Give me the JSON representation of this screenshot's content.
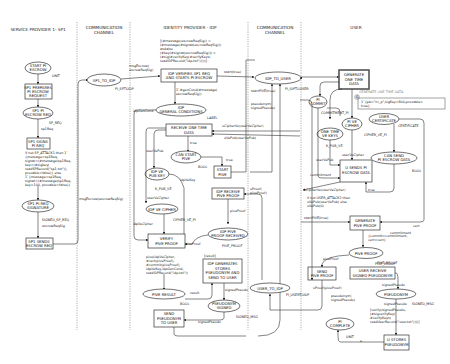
{
  "lanes": [
    {
      "title_1": "SERVICE PROVIDER 1- SP1",
      "title_2": ""
    },
    {
      "title_1": "COMMUNICATION",
      "title_2": "CHANNEL"
    },
    {
      "title_1": "IDENTITY PROVIDER - IDP",
      "title_2": ""
    },
    {
      "title_1": "COMMUNICATION",
      "title_2": "CHANNEL"
    },
    {
      "title_1": "USER",
      "title_2": ""
    }
  ],
  "sp1": {
    "start": {
      "l1": "START PI",
      "l2": "ESCROW",
      "type": "UNIT"
    },
    "prepares": {
      "l1": "SP1 PREPARES",
      "l2": "PI ESCROW",
      "l3": "REQUEST"
    },
    "req": {
      "l1": "SP1 PI",
      "l2": "ESCROW REQ",
      "type": "SP_REQ",
      "arc": "sp1Req"
    },
    "signs": {
      "l1": "SP1 SIGNS",
      "l2": "PI REQ"
    },
    "guard": [
      "if not SP_ATTACK1 then 1`",
      "{message=sp1Req,",
      "signat=(#message(sp1Req,",
      "key=(#sigkey(",
      "readSPRecord(\"sp1.txt\")),",
      "provable=false)} else",
      "1`{message=sp1Req,",
      "signat=(#message(sp1Req,",
      "key=100, provable=false)}"
    ],
    "signature": {
      "l1": "SP1 PI REQ",
      "l2": "SIGNATURE",
      "type": "SIGNED_SP_REQ",
      "arc": "escrowReqSig"
    },
    "sends": {
      "l1": "SP1 SENDS",
      "l2": "ESCROW REQ"
    }
  },
  "channel1": {
    "place": "SP1_TO_IDP",
    "type": "PI_SPTOIDP",
    "arc_in": "msgEscrow(escrowReqSig)",
    "arc_out_1": "msgEscrow(",
    "arc_out_2": "escrowReqSig)"
  },
  "idp": {
    "guard_top": [
      "[(#message(escrowReqSig)) =",
      "(#message(#signat(escrowReqSig)))",
      "andalso",
      "(#key(#signat(escrowReqSig))) =",
      "(#sig(#verifyKey(#verifyKeys(",
      "readIDPRecord(\"idp.txt\")))))]"
    ],
    "verifies": {
      "l1": "IDP VERIFIES SP1 REQ",
      "l2": "AND STARTS PI ESCROW"
    },
    "gen_arc_1": "1`#genCond(#message(",
    "gen_arc_2": "escrowReqSig))",
    "idpGenCond": "idpGenCond",
    "gen_cond": {
      "l1": "IDP",
      "l2": "GENERAL CONDITIONS",
      "type": "LABEL"
    },
    "receive": {
      "l1": "RECEIVE ONE TIME",
      "l2": "DATA"
    },
    "arc_ucipher": "uCipherVe(userVeCipher)",
    "arc_uvepub": "uVePub(userVePub)",
    "true1": "true",
    "can_start": {
      "l1": "CAN START",
      "l2": "PIVE",
      "type": "BOOL"
    },
    "true2": "true",
    "start_pive": {
      "l1": "START",
      "l2": "PIVE"
    },
    "userVePub": "userVePub",
    "ve_pub": {
      "l1": "IDP VE",
      "l2": "PUB KEY",
      "type": "K_PUB_VE"
    },
    "idpVeKey": "idpVeKey",
    "userVeCipher": "userVeCipher",
    "ve_cipher": {
      "l1": "IDP VE CIPHER",
      "type": "CIPHER_VE_PI"
    },
    "idpVeCipher": "idpVeCipher",
    "receive_proof": {
      "l1": "IDP RECEIVE",
      "l2": "PIVE PROOF"
    },
    "arc_uproof_1": "uProof(",
    "arc_uproof_2": "piveProof)",
    "piveProof": "piveProof",
    "proof_received": {
      "l1": "IDP PIVE",
      "l2": "PROOF RECEIVED",
      "type": "PIVE_PROOF"
    },
    "piveProof2": "piveProof",
    "verify": {
      "l1": "VERIFY",
      "l2": "PIVE PROOF"
    },
    "verify_expr": [
      "pive(idpVeCipher,",
      "#cert(piveProof),",
      "#commit(piveProof),",
      "idpVeKey,idpGenCond,",
      "readIDPRecord(\"idp.txt\"))"
    ],
    "result_bracket": "[result]",
    "generates": {
      "l1": "IDP GENERATES",
      "l2": "STORES",
      "l3": "PSEUDONYM AND",
      "l4": "SEND TO USER"
    },
    "pive_result": {
      "l1": "PIVE RESULT",
      "type": "BOOL",
      "arc": "result"
    },
    "signedPseudo": "signedPseudo",
    "pseudonym_signed": {
      "l1": "PSEUDONYM",
      "l2": "SIGNED",
      "type": "SIGNED_MSG"
    },
    "send_pseudo": {
      "l1": "SEND",
      "l2": "PSEUDONYM",
      "l3": "TO USER",
      "arc": "signedPseudo"
    }
  },
  "channel2": {
    "idp_to_user": {
      "label": "IDP_TO_USER",
      "type": "PI_IDPTOUSER"
    },
    "startTrue": "start(true)",
    "startPIVE": "startPIVE(true)",
    "pseudo_1": "pseudonym(",
    "pseudo_2": "signedPseudo)",
    "user_to_idp": {
      "label": "USER_TO_IDP",
      "type": "PI_USERTOIDP"
    }
  },
  "user": {
    "generate": {
      "l1": "GENERATE",
      "l2": "ONE TIME",
      "l3": "DATA"
    },
    "fusion_label": "GENERATE ONE TIME DATA",
    "fusion_tag": "G",
    "fusion_expr_1": "1`{pb=\"nr_p\",sigKey=800,provable=",
    "fusion_expr_2": "true}",
    "pi_commit": {
      "l1": "PI",
      "l2": "COMMIT",
      "type": "COMMITMENT_PI"
    },
    "one_time": {
      "l1": "ONE TIME",
      "l2": "VE KEYS",
      "type": "K_PUB_VE"
    },
    "pi_ve_cipher": {
      "l1": "PI VE",
      "l2": "CIPHER",
      "type": "CIPHER_VE_PI"
    },
    "certificate": {
      "l1": "USER",
      "l2": "CERTIFICATE",
      "type": "CERTIFICATE"
    },
    "userVePub": "userVePub",
    "userVeCipher": "userVeCipher",
    "commitment": "commitment",
    "sends": {
      "l1": "U SENDS PI",
      "l2": "ESCROW DATA"
    },
    "can_send": {
      "l1": "CAN SEND",
      "l2": "PI ESCROW DATA",
      "type": "BOOL"
    },
    "true": "true",
    "uCipher_arc": "uCipherVe(userVeCipher)",
    "guard": [
      "if not USER_ATTACK2 then",
      "uVePub(userVePub) else",
      "uVePub(0)"
    ],
    "startPIVE": "startPIVE(true)",
    "gen_proof": {
      "l1": "GENERATE",
      "l2": "PIVE PROOF"
    },
    "cert": "cert",
    "commitment2": "commitment",
    "proof_expr_1": "{commit=commitment,",
    "proof_expr_2": "cert=cert}",
    "pive_proof": {
      "l1": "PIVE PROOF",
      "type": "PIVE_PROOF"
    },
    "piveProof": "piveProof",
    "send_proof": {
      "l1": "SEND",
      "l2": "PIVE PROOF",
      "arc": "uProof(piveProof)"
    },
    "receive_pseudo": {
      "l1": "USER RECEIVE",
      "l2": "SIGNED PSEUDONYM"
    },
    "signedPseudo": "signedPseudo",
    "pseudonym": {
      "l1": "PSEUDONYM",
      "type": "SIGNED_MSG",
      "arc": "signedPseudo"
    },
    "verify_expr": [
      "[verify(signedPseudo,",
      "(#sigverifyKey(",
      "#verifyKeys(",
      "readUserRecord(\"user.txt\"))))]"
    ],
    "complete": {
      "l1": "PI",
      "l2": "COMPLETE",
      "type": "UNIT",
      "arc": "e"
    },
    "stores": {
      "l1": "U STORES",
      "l2": "PSEUDONYM"
    }
  }
}
